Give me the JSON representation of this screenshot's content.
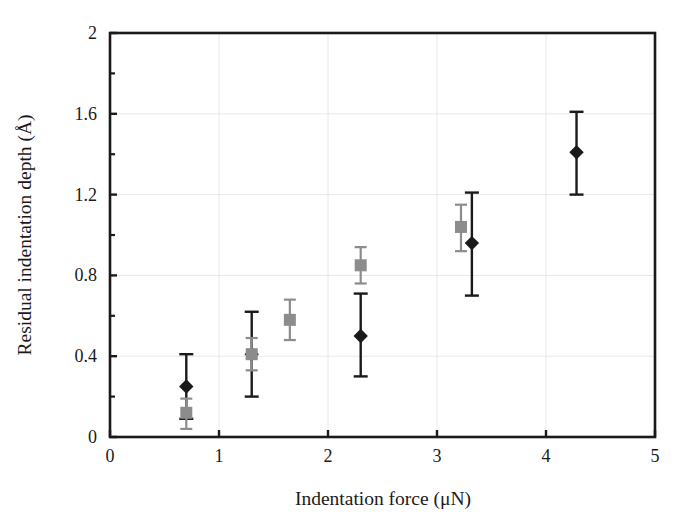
{
  "chart_data": {
    "type": "scatter",
    "title": "",
    "xlabel": "Indentation force (μN)",
    "ylabel": "Residual indentation depth (Å)",
    "xlim": [
      0,
      5
    ],
    "ylim": [
      0,
      2
    ],
    "xticks": [
      "0",
      "1",
      "2",
      "3",
      "4",
      "5"
    ],
    "xtick_values": [
      0,
      1,
      2,
      3,
      4,
      5
    ],
    "yticks": [
      "0",
      "0.4",
      "0.8",
      "1.2",
      "1.6",
      "2"
    ],
    "ytick_values": [
      0,
      0.4,
      0.8,
      1.2,
      1.6,
      2
    ],
    "grid": true,
    "grid_color": "#e8e8e8",
    "legend": "none",
    "frame_color": "#1a1a1a",
    "background": "#ffffff",
    "series": [
      {
        "name": "black-diamond-series",
        "marker": "diamond",
        "color": "#1a1a1a",
        "points": [
          {
            "x": 0.7,
            "y": 0.25,
            "yerr_low": 0.09,
            "yerr_high": 0.41
          },
          {
            "x": 1.3,
            "y": 0.41,
            "yerr_low": 0.2,
            "yerr_high": 0.62
          },
          {
            "x": 2.3,
            "y": 0.5,
            "yerr_low": 0.3,
            "yerr_high": 0.71
          },
          {
            "x": 3.32,
            "y": 0.96,
            "yerr_low": 0.7,
            "yerr_high": 1.21
          },
          {
            "x": 4.28,
            "y": 1.41,
            "yerr_low": 1.2,
            "yerr_high": 1.61
          }
        ]
      },
      {
        "name": "gray-square-series",
        "marker": "square",
        "color": "#8c8c8c",
        "points": [
          {
            "x": 0.7,
            "y": 0.12,
            "yerr_low": 0.04,
            "yerr_high": 0.19
          },
          {
            "x": 1.3,
            "y": 0.41,
            "yerr_low": 0.33,
            "yerr_high": 0.49
          },
          {
            "x": 1.65,
            "y": 0.58,
            "yerr_low": 0.48,
            "yerr_high": 0.68
          },
          {
            "x": 2.3,
            "y": 0.85,
            "yerr_low": 0.76,
            "yerr_high": 0.94
          },
          {
            "x": 3.22,
            "y": 1.04,
            "yerr_low": 0.92,
            "yerr_high": 1.15
          }
        ]
      }
    ]
  }
}
